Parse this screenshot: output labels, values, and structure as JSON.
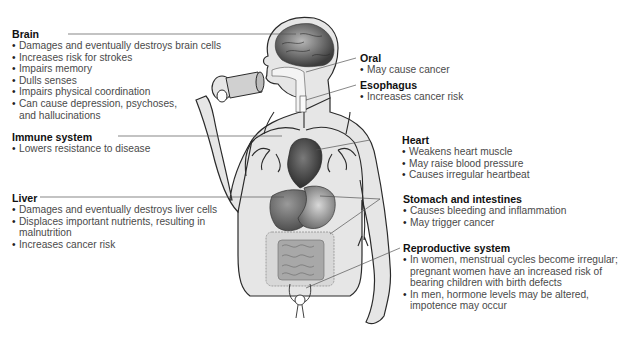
{
  "diagram": {
    "colors": {
      "body_fill": "#e6e6e6",
      "outline": "#2a2a2a",
      "organ_dark": "#5a5a5a",
      "organ_mid": "#8c8c8c",
      "leader_line": "#555555",
      "text": "#4a4a4a",
      "heading": "#111111"
    },
    "labels": {
      "brain": {
        "title": "Brain",
        "items": [
          "Damages and eventually destroys brain cells",
          "Increases risk for strokes",
          "Impairs memory",
          "Dulls senses",
          "Impairs physical coordination",
          "Can cause depression, psychoses, and hallucinations"
        ]
      },
      "immune": {
        "title": "Immune system",
        "items": [
          "Lowers resistance to disease"
        ]
      },
      "liver": {
        "title": "Liver",
        "items": [
          "Damages and eventually destroys liver cells",
          "Displaces important nutrients, resulting in malnutrition",
          "Increases cancer risk"
        ]
      },
      "oral": {
        "title": "Oral",
        "items": [
          "May cause cancer"
        ]
      },
      "esophagus": {
        "title": "Esophagus",
        "items": [
          "Increases cancer risk"
        ]
      },
      "heart": {
        "title": "Heart",
        "items": [
          "Weakens heart muscle",
          "May raise blood pressure",
          "Causes irregular heartbeat"
        ]
      },
      "stomach": {
        "title": "Stomach and intestines",
        "items": [
          "Causes bleeding and inflammation",
          "May trigger cancer"
        ]
      },
      "reproductive": {
        "title": "Reproductive system",
        "items": [
          "In women, menstrual cycles become irregular; pregnant women have an increased risk of bearing children with birth defects",
          "In men, hormone levels may be altered, impotence may occur"
        ]
      }
    }
  }
}
